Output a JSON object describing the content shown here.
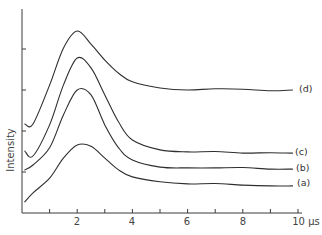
{
  "chart_data": {
    "type": "line",
    "title": "",
    "xlabel": "μs",
    "ylabel": "Intensity",
    "xlim": [
      0,
      10
    ],
    "ylim": [
      0,
      5
    ],
    "grid": false,
    "legend": "inline labels at right end of each curve",
    "x_ticks": [
      1,
      2,
      3,
      4,
      5,
      6,
      7,
      8,
      9,
      10
    ],
    "x_tick_labels": [
      {
        "value": 2,
        "label": "2"
      },
      {
        "value": 4,
        "label": "4"
      },
      {
        "value": 6,
        "label": "6"
      },
      {
        "value": 8,
        "label": "8"
      },
      {
        "value": 10,
        "label": "10 μs"
      }
    ],
    "y_ticks": [
      1,
      2,
      3,
      4
    ],
    "y_tick_labels": [],
    "x": [
      0.1,
      0.4,
      1.0,
      1.5,
      2.0,
      2.5,
      3.0,
      3.5,
      4.0,
      5.0,
      6.0,
      7.0,
      8.0,
      9.0,
      9.8
    ],
    "series": [
      {
        "name": "(a)",
        "label": "(a)",
        "values": [
          0.27,
          0.49,
          0.85,
          1.34,
          1.66,
          1.63,
          1.34,
          1.05,
          0.88,
          0.76,
          0.71,
          0.72,
          0.68,
          0.66,
          0.66
        ]
      },
      {
        "name": "(b)",
        "label": "(b)",
        "values": [
          1.05,
          1.17,
          1.59,
          2.39,
          3.0,
          2.88,
          2.15,
          1.59,
          1.29,
          1.12,
          1.1,
          1.1,
          1.11,
          1.07,
          1.07
        ]
      },
      {
        "name": "(c)",
        "label": "(c)",
        "values": [
          1.51,
          1.39,
          2.15,
          3.12,
          3.78,
          3.54,
          2.88,
          2.22,
          1.78,
          1.54,
          1.49,
          1.5,
          1.46,
          1.47,
          1.46
        ]
      },
      {
        "name": "(d)",
        "label": "(d)",
        "values": [
          2.17,
          2.17,
          3.12,
          4.02,
          4.44,
          4.12,
          3.73,
          3.41,
          3.2,
          3.05,
          3.0,
          3.03,
          3.02,
          2.98,
          3.0
        ]
      }
    ]
  },
  "labels": {
    "ylabel": "Intensity",
    "x2": "2",
    "x4": "4",
    "x6": "6",
    "x8": "8",
    "x10": "10 μs",
    "a": "(a)",
    "b": "(b)",
    "c": "(c)",
    "d": "(d)"
  }
}
